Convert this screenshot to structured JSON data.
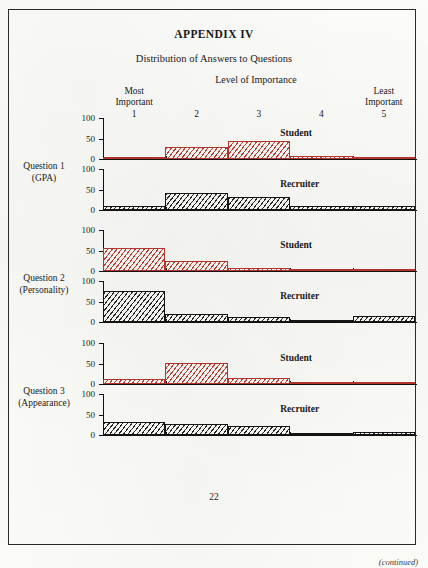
{
  "document": {
    "appendix_title": "APPENDIX IV",
    "subtitle": "Distribution of Answers to Questions",
    "axis_title": "Level of Importance",
    "page_number": "22",
    "continued_note": "(continued)"
  },
  "axis": {
    "categories": [
      {
        "tag_line1": "Most",
        "tag_line2": "Important",
        "num": "1"
      },
      {
        "tag_line1": "",
        "tag_line2": "",
        "num": "2"
      },
      {
        "tag_line1": "",
        "tag_line2": "",
        "num": "3"
      },
      {
        "tag_line1": "",
        "tag_line2": "",
        "num": "4"
      },
      {
        "tag_line1": "Least",
        "tag_line2": "Important",
        "num": "5"
      }
    ],
    "y_ticks": [
      "100",
      "50",
      "0"
    ],
    "series_labels": {
      "student": "Student",
      "recruiter": "Recruiter"
    }
  },
  "questions": [
    {
      "label_line1": "Question 1",
      "label_line2": "(GPA)"
    },
    {
      "label_line1": "Question 2",
      "label_line2": "(Personality)"
    },
    {
      "label_line1": "Question 3",
      "label_line2": "(Appearance)"
    }
  ],
  "colors": {
    "student": "#b3342c",
    "recruiter": "#141414",
    "paper": "#fbfbf9",
    "border": "#2b2b2b"
  },
  "chart_data": {
    "type": "bar",
    "title": "Distribution of Answers to Questions",
    "subtitle": "APPENDIX IV",
    "xlabel": "Level of Importance",
    "ylabel": "Percent",
    "ylim": [
      0,
      100
    ],
    "y_ticks": [
      0,
      50,
      100
    ],
    "grid": false,
    "legend": "inline-right",
    "categories": [
      "1",
      "2",
      "3",
      "4",
      "5"
    ],
    "category_anchors": [
      "Most Important",
      "",
      "",
      "",
      "Least Important"
    ],
    "panels": [
      {
        "question": "Question 1 (GPA)",
        "series": [
          {
            "name": "Student",
            "values": [
              5,
              30,
              45,
              8,
              4
            ]
          },
          {
            "name": "Recruiter",
            "values": [
              10,
              42,
              32,
              10,
              10
            ]
          }
        ]
      },
      {
        "question": "Question 2 (Personality)",
        "series": [
          {
            "name": "Student",
            "values": [
              55,
              25,
              8,
              5,
              5
            ]
          },
          {
            "name": "Recruiter",
            "values": [
              75,
              20,
              12,
              0,
              14
            ]
          }
        ]
      },
      {
        "question": "Question 3 (Appearance)",
        "series": [
          {
            "name": "Student",
            "values": [
              12,
              52,
              15,
              4,
              4
            ]
          },
          {
            "name": "Recruiter",
            "values": [
              32,
              28,
              22,
              0,
              8
            ]
          }
        ]
      }
    ]
  }
}
